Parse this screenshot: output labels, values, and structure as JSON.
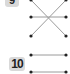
{
  "questions": [
    {
      "number": "9",
      "left_dots": [
        {
          "x": 31,
          "y": 0
        },
        {
          "x": 31,
          "y": 17
        },
        {
          "x": 31,
          "y": 36
        }
      ],
      "right_dots": [
        {
          "x": 66,
          "y": 0
        },
        {
          "x": 66,
          "y": 17
        },
        {
          "x": 66,
          "y": 36
        }
      ],
      "connections": [
        [
          0,
          2
        ],
        [
          1,
          1
        ],
        [
          2,
          0
        ]
      ]
    },
    {
      "number": "10",
      "left_dots": [
        {
          "x": 31,
          "y": 55
        },
        {
          "x": 31,
          "y": 72
        }
      ],
      "right_dots": [
        {
          "x": 66,
          "y": 55
        },
        {
          "x": 66,
          "y": 72
        }
      ],
      "connections": [
        [
          0,
          0
        ],
        [
          1,
          1
        ]
      ]
    }
  ],
  "colors": {
    "line": "#9a9a9a",
    "dot": "#222222",
    "badge": "#d9d9d9"
  }
}
